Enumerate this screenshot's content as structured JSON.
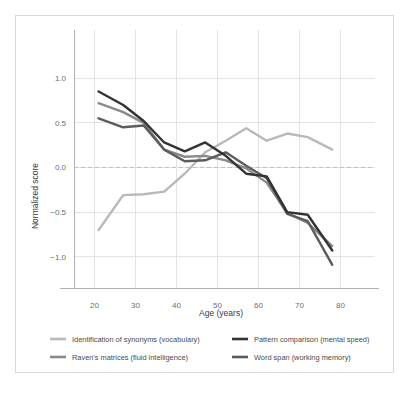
{
  "chart_data": {
    "type": "line",
    "title": "",
    "xlabel": "Age (years)",
    "ylabel": "Normalized score",
    "xlim": [
      15,
      85
    ],
    "ylim": [
      -1.35,
      1.45
    ],
    "xticks": [
      20,
      30,
      40,
      50,
      60,
      70,
      80
    ],
    "yticks": [
      1.0,
      0.5,
      0.0,
      -0.5,
      -1.0
    ],
    "ytick_labels": [
      "1.0",
      "0.5",
      "0.0",
      "−0.5",
      "−1.0"
    ],
    "xtick_labels": [
      "20",
      "30",
      "40",
      "50",
      "60",
      "70",
      "80"
    ],
    "grid": true,
    "zero_reference_line": 0.0,
    "legend_position": "below",
    "series": [
      {
        "name": "Identification of synonyms (vocabulary)",
        "color": "#b9b9b9",
        "x": [
          21,
          27,
          32,
          37,
          42,
          47,
          52,
          57,
          62,
          67,
          72,
          78
        ],
        "y": [
          -0.7,
          -0.31,
          -0.3,
          -0.27,
          -0.07,
          0.17,
          0.3,
          0.44,
          0.3,
          0.38,
          0.34,
          0.2
        ]
      },
      {
        "name": "Raven's matrices (fluid intelligence)",
        "color": "#8a8a8a",
        "x": [
          21,
          27,
          32,
          37,
          42,
          47,
          52,
          57,
          62,
          67,
          72,
          78
        ],
        "y": [
          0.72,
          0.62,
          0.5,
          0.2,
          0.12,
          0.13,
          0.08,
          -0.01,
          -0.17,
          -0.51,
          -0.62,
          -0.88
        ]
      },
      {
        "name": "Pattern comparison (mental speed)",
        "color": "#333333",
        "x": [
          21,
          27,
          32,
          37,
          42,
          47,
          52,
          57,
          62,
          67,
          72,
          78
        ],
        "y": [
          0.85,
          0.7,
          0.52,
          0.28,
          0.18,
          0.28,
          0.13,
          -0.07,
          -0.1,
          -0.5,
          -0.53,
          -0.93
        ]
      },
      {
        "name": "Word span (working memory)",
        "color": "#5c5c5c",
        "x": [
          21,
          27,
          32,
          37,
          42,
          47,
          52,
          57,
          62,
          67,
          72,
          78
        ],
        "y": [
          0.55,
          0.45,
          0.47,
          0.2,
          0.07,
          0.08,
          0.17,
          0.02,
          -0.12,
          -0.52,
          -0.6,
          -1.09
        ]
      }
    ]
  },
  "legend": {
    "items": [
      {
        "label": "Identification of synonyms (vocabulary)",
        "color": "#b9b9b9"
      },
      {
        "label": "Pattern comparison (mental speed)",
        "color": "#333333"
      },
      {
        "label": "Raven's matrices (fluid intelligence)",
        "color": "#8a8a8a"
      },
      {
        "label": "Word span (working memory)",
        "color": "#5c5c5c"
      }
    ]
  }
}
